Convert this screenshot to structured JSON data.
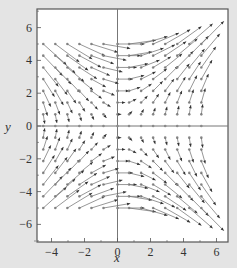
{
  "chart_data": {
    "type": "vector_field",
    "title": "",
    "xlabel": "x",
    "ylabel": "y",
    "xlim": [
      -5.3,
      6.3
    ],
    "ylim": [
      -7.1,
      7.2
    ],
    "xticks": [
      -4,
      -2,
      0,
      2,
      4,
      6
    ],
    "yticks": [
      -6,
      -4,
      -2,
      0,
      2,
      4,
      6
    ],
    "xtick_labels": [
      "−4",
      "−2",
      "0",
      "2",
      "4",
      "6"
    ],
    "ytick_labels": [
      "−6",
      "−4",
      "−2",
      "0",
      "2",
      "4",
      "6"
    ],
    "grid": false,
    "axes_through_origin": true,
    "field": {
      "description": "Direction field approximately dx/dt = y^2, dy/dt = x*y",
      "u": "y^2",
      "v": "x*y",
      "sample_x": [
        -4.5,
        -3.77,
        -3.04,
        -2.31,
        -1.58,
        -0.85,
        0.0,
        0.7,
        1.43,
        2.16,
        2.89,
        3.62,
        4.35,
        5.08
      ],
      "sample_y": [
        5.0,
        4.29,
        3.57,
        2.86,
        2.14,
        1.43,
        0.71,
        0.0,
        -0.71,
        -1.43,
        -2.14,
        -2.86,
        -3.57,
        -4.29,
        -5.0
      ],
      "max_arrow_length_units": 1.95
    },
    "colors": {
      "background": "#e4e4e4",
      "plot_area": "#ffffff",
      "frame": "#555555",
      "axis": "#777777",
      "arrow": "#333333",
      "dot": "#8a8a8a"
    }
  }
}
